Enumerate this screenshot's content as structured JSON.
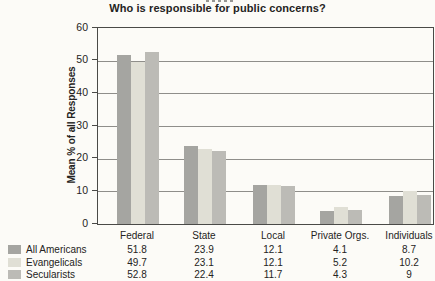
{
  "figure": {
    "title": "Who is responsible for public concerns?",
    "y_axis_label": "Mean % of all Responses"
  },
  "chart_data": {
    "type": "bar",
    "title": "Who is responsible for public concerns?",
    "xlabel": "",
    "ylabel": "Mean % of all Responses",
    "ylim": [
      0,
      60
    ],
    "yticks": [
      0,
      10,
      20,
      30,
      40,
      50,
      60
    ],
    "grid": true,
    "legend_position": "bottom table with values",
    "categories": [
      "Federal",
      "State",
      "Local",
      "Private Orgs.",
      "Individuals"
    ],
    "series": [
      {
        "name": "All Americans",
        "color": "#a5a5a1",
        "values": [
          51.8,
          23.9,
          12.1,
          4.1,
          8.7
        ]
      },
      {
        "name": "Evangelicals",
        "color": "#e0dfd5",
        "values": [
          49.7,
          23.1,
          12.1,
          5.2,
          10.2
        ]
      },
      {
        "name": "Secularists",
        "color": "#bcbbb6",
        "values": [
          52.8,
          22.4,
          11.7,
          4.3,
          9
        ]
      }
    ]
  }
}
